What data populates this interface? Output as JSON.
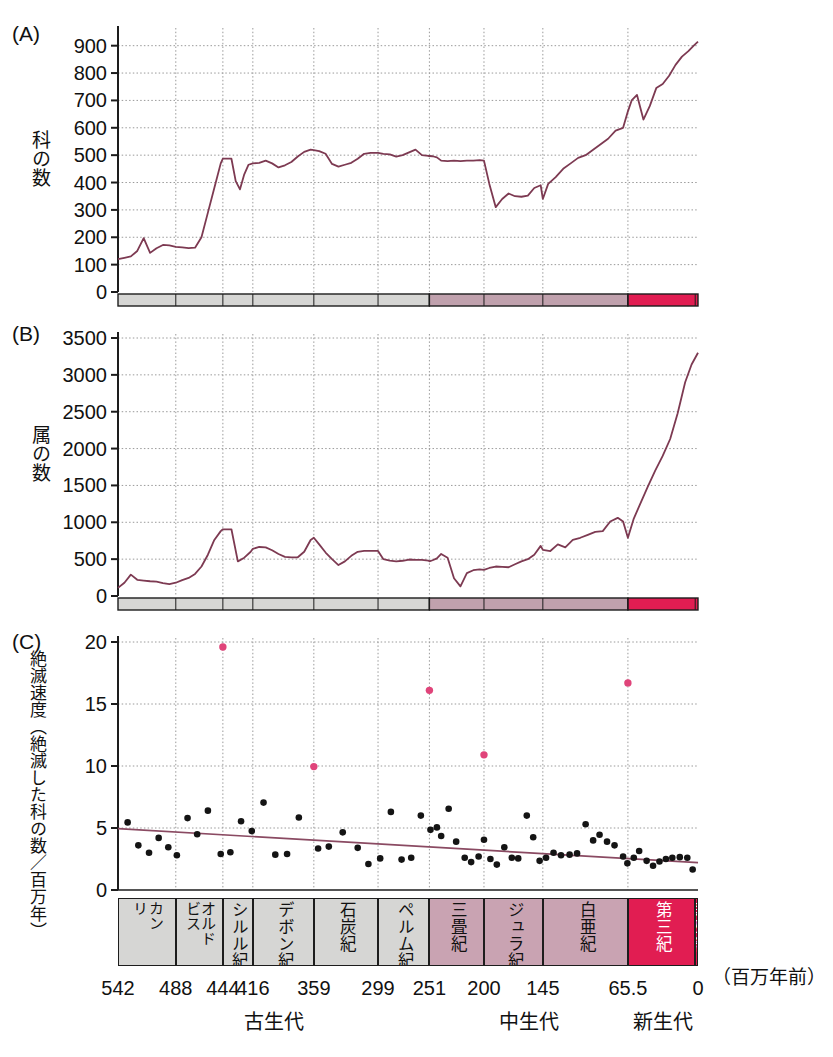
{
  "figure": {
    "panels": [
      "(A)",
      "(B)",
      "(C)"
    ],
    "x_unit_label": "（百万年前）",
    "x_ticks": [
      {
        "label": "542",
        "value": 542
      },
      {
        "label": "488",
        "value": 488
      },
      {
        "label": "444",
        "value": 444
      },
      {
        "label": "416",
        "value": 416
      },
      {
        "label": "359",
        "value": 359
      },
      {
        "label": "299",
        "value": 299
      },
      {
        "label": "251",
        "value": 251
      },
      {
        "label": "200",
        "value": 200
      },
      {
        "label": "145",
        "value": 145
      },
      {
        "label": "65.5",
        "value": 65.5
      },
      {
        "label": "0",
        "value": 0
      }
    ],
    "eras": [
      {
        "name": "古生代",
        "start": 542,
        "end": 251,
        "color": "#d6d6d4"
      },
      {
        "name": "中生代",
        "start": 251,
        "end": 65.5,
        "color": "#c0a1ad"
      },
      {
        "name": "新生代",
        "start": 65.5,
        "end": 0,
        "color": "#e11d52"
      }
    ],
    "periods": [
      {
        "name": "カンブリア紀",
        "start": 542,
        "end": 488,
        "color": "#d6d6d4",
        "lines": [
          "リ",
          "カン"
        ]
      },
      {
        "name": "オルドビス紀",
        "start": 488,
        "end": 444,
        "color": "#d6d6d4",
        "lines": [
          "ビス",
          "オルド"
        ]
      },
      {
        "name": "シルル紀",
        "start": 444,
        "end": 416,
        "color": "#d6d6d4",
        "lines": [
          "シルル紀"
        ]
      },
      {
        "name": "デボン紀",
        "start": 416,
        "end": 359,
        "color": "#d6d6d4",
        "lines": [
          "デボン紀"
        ]
      },
      {
        "name": "石炭紀",
        "start": 359,
        "end": 299,
        "color": "#d6d6d4",
        "lines": [
          "石炭紀"
        ]
      },
      {
        "name": "ペルム紀",
        "start": 299,
        "end": 251,
        "color": "#d6d6d4",
        "lines": [
          "ペルム紀"
        ]
      },
      {
        "name": "三畳紀",
        "start": 251,
        "end": 200,
        "color": "#c9a3b2",
        "lines": [
          "三畳紀"
        ]
      },
      {
        "name": "ジュラ紀",
        "start": 200,
        "end": 145,
        "color": "#c9a3b2",
        "lines": [
          "ジュラ紀"
        ]
      },
      {
        "name": "白亜紀",
        "start": 145,
        "end": 65.5,
        "color": "#c9a3b2",
        "lines": [
          "白亜紀"
        ]
      },
      {
        "name": "第三紀",
        "start": 65.5,
        "end": 2.6,
        "color": "#e11d52",
        "lines": [
          "第三紀"
        ]
      },
      {
        "name": "第四紀",
        "start": 2.6,
        "end": 0,
        "color": "#e11d52",
        "lines": [
          "第四紀"
        ]
      }
    ],
    "colors": {
      "curve": "#7d3a52",
      "marker_normal": "#141414",
      "marker_extinction": "#e0447a",
      "trend_line": "#8a4a62",
      "grid": "#9a9a9a",
      "axis": "#1d1d1d",
      "paleozoic_bar": "#d6d6d4",
      "mesozoic_bar": "#c0a1ad",
      "cenozoic_bar": "#e11d52"
    }
  },
  "chart_data": [
    {
      "type": "line",
      "panel": "(A)",
      "title": "",
      "ylabel": "科の数",
      "xlabel": "（百万年前）",
      "ylim": [
        0,
        950
      ],
      "xlim": [
        542,
        0
      ],
      "y_ticks": [
        0,
        100,
        200,
        300,
        400,
        500,
        600,
        700,
        800,
        900
      ],
      "grid": true,
      "series": [
        {
          "name": "科の数",
          "x": [
            542,
            536,
            530,
            524,
            518,
            512,
            506,
            500,
            494,
            488,
            482,
            476,
            470,
            464,
            458,
            452,
            446,
            444,
            440,
            436,
            432,
            428,
            424,
            420,
            416,
            410,
            404,
            398,
            392,
            386,
            380,
            374,
            368,
            362,
            359,
            354,
            348,
            342,
            336,
            330,
            324,
            318,
            312,
            306,
            300,
            299,
            294,
            288,
            282,
            276,
            270,
            264,
            258,
            252,
            251,
            248,
            244,
            240,
            234,
            228,
            222,
            216,
            210,
            204,
            200,
            195,
            189,
            183,
            177,
            171,
            165,
            159,
            153,
            147,
            145,
            140,
            133,
            126,
            119,
            112,
            105,
            98,
            91,
            84,
            77,
            70,
            65.5,
            62,
            57,
            51,
            45,
            39,
            33,
            27,
            21,
            15,
            9,
            4,
            0
          ],
          "y": [
            120,
            125,
            130,
            150,
            197,
            143,
            160,
            172,
            170,
            165,
            163,
            160,
            162,
            200,
            290,
            380,
            470,
            487,
            487,
            487,
            405,
            375,
            430,
            465,
            470,
            472,
            480,
            470,
            455,
            463,
            475,
            495,
            512,
            520,
            518,
            515,
            505,
            468,
            458,
            465,
            472,
            487,
            505,
            508,
            508,
            508,
            505,
            503,
            495,
            500,
            510,
            520,
            500,
            497,
            497,
            496,
            492,
            480,
            478,
            480,
            478,
            480,
            480,
            482,
            480,
            395,
            310,
            340,
            360,
            350,
            348,
            352,
            380,
            390,
            340,
            395,
            420,
            450,
            470,
            490,
            500,
            520,
            540,
            560,
            590,
            600,
            660,
            700,
            720,
            630,
            680,
            745,
            760,
            790,
            830,
            860,
            880,
            900,
            915
          ]
        }
      ]
    },
    {
      "type": "line",
      "panel": "(B)",
      "title": "",
      "ylabel": "属の数",
      "xlabel": "（百万年前）",
      "ylim": [
        0,
        3500
      ],
      "xlim": [
        542,
        0
      ],
      "y_ticks": [
        0,
        500,
        1000,
        1500,
        2000,
        2500,
        3000,
        3500
      ],
      "grid": true,
      "series": [
        {
          "name": "属の数",
          "x": [
            542,
            536,
            530,
            524,
            518,
            512,
            506,
            500,
            494,
            488,
            482,
            476,
            470,
            464,
            458,
            452,
            446,
            444,
            440,
            436,
            430,
            424,
            418,
            416,
            410,
            404,
            398,
            392,
            386,
            380,
            374,
            368,
            362,
            359,
            354,
            348,
            342,
            336,
            330,
            324,
            318,
            312,
            306,
            300,
            299,
            294,
            288,
            282,
            276,
            270,
            264,
            258,
            252,
            251,
            248,
            244,
            240,
            234,
            228,
            222,
            216,
            210,
            204,
            200,
            195,
            189,
            183,
            177,
            171,
            165,
            159,
            153,
            147,
            145,
            138,
            131,
            124,
            117,
            110,
            103,
            96,
            89,
            82,
            75,
            70,
            65.5,
            60,
            54,
            47,
            40,
            33,
            26,
            19,
            12,
            6,
            0
          ],
          "y": [
            110,
            180,
            290,
            220,
            210,
            200,
            195,
            175,
            160,
            180,
            215,
            245,
            300,
            400,
            560,
            760,
            880,
            905,
            905,
            905,
            470,
            520,
            600,
            640,
            665,
            660,
            620,
            570,
            530,
            525,
            525,
            600,
            760,
            790,
            700,
            590,
            500,
            420,
            470,
            545,
            600,
            612,
            612,
            612,
            612,
            500,
            480,
            470,
            478,
            495,
            490,
            490,
            480,
            470,
            485,
            510,
            570,
            520,
            240,
            130,
            310,
            350,
            360,
            355,
            380,
            400,
            395,
            390,
            430,
            470,
            500,
            560,
            680,
            625,
            610,
            700,
            660,
            760,
            790,
            830,
            870,
            880,
            1010,
            1060,
            1010,
            790,
            1050,
            1250,
            1480,
            1700,
            1900,
            2130,
            2480,
            2900,
            3140,
            3300
          ]
        }
      ]
    },
    {
      "type": "scatter",
      "panel": "(C)",
      "title": "",
      "ylabel": "絶滅速度（絶滅した科の数／百万年）",
      "xlabel": "（百万年前）",
      "ylim": [
        0,
        20
      ],
      "xlim": [
        542,
        0
      ],
      "y_ticks": [
        0,
        5,
        10,
        15,
        20
      ],
      "grid": true,
      "trend": {
        "x": [
          542,
          0
        ],
        "y": [
          4.95,
          2.2
        ],
        "color": "#8a4a62"
      },
      "points_normal": [
        {
          "x": 533,
          "y": 5.45
        },
        {
          "x": 523,
          "y": 3.6
        },
        {
          "x": 513,
          "y": 3.0
        },
        {
          "x": 504,
          "y": 4.2
        },
        {
          "x": 495,
          "y": 3.45
        },
        {
          "x": 487,
          "y": 2.8
        },
        {
          "x": 477,
          "y": 5.8
        },
        {
          "x": 468,
          "y": 4.5
        },
        {
          "x": 458,
          "y": 6.4
        },
        {
          "x": 446,
          "y": 2.9
        },
        {
          "x": 437,
          "y": 3.05
        },
        {
          "x": 427,
          "y": 5.55
        },
        {
          "x": 417,
          "y": 4.75
        },
        {
          "x": 406,
          "y": 7.05
        },
        {
          "x": 395,
          "y": 2.85
        },
        {
          "x": 384,
          "y": 2.9
        },
        {
          "x": 373,
          "y": 5.85
        },
        {
          "x": 355,
          "y": 3.35
        },
        {
          "x": 345,
          "y": 3.5
        },
        {
          "x": 332,
          "y": 4.65
        },
        {
          "x": 318,
          "y": 3.4
        },
        {
          "x": 308,
          "y": 2.1
        },
        {
          "x": 297,
          "y": 2.55
        },
        {
          "x": 287,
          "y": 6.3
        },
        {
          "x": 277,
          "y": 2.45
        },
        {
          "x": 268,
          "y": 2.6
        },
        {
          "x": 259,
          "y": 6.0
        },
        {
          "x": 250,
          "y": 4.85
        },
        {
          "x": 244,
          "y": 5.05
        },
        {
          "x": 240,
          "y": 4.35
        },
        {
          "x": 233,
          "y": 6.55
        },
        {
          "x": 226,
          "y": 3.9
        },
        {
          "x": 218,
          "y": 2.6
        },
        {
          "x": 212,
          "y": 2.25
        },
        {
          "x": 205,
          "y": 2.7
        },
        {
          "x": 200,
          "y": 4.05
        },
        {
          "x": 194,
          "y": 2.5
        },
        {
          "x": 188,
          "y": 2.05
        },
        {
          "x": 181,
          "y": 3.45
        },
        {
          "x": 174,
          "y": 2.6
        },
        {
          "x": 168,
          "y": 2.55
        },
        {
          "x": 160,
          "y": 6.0
        },
        {
          "x": 154,
          "y": 4.25
        },
        {
          "x": 148,
          "y": 2.35
        },
        {
          "x": 142,
          "y": 2.6
        },
        {
          "x": 135,
          "y": 3.0
        },
        {
          "x": 128,
          "y": 2.8
        },
        {
          "x": 120,
          "y": 2.85
        },
        {
          "x": 113,
          "y": 2.95
        },
        {
          "x": 105,
          "y": 5.3
        },
        {
          "x": 98,
          "y": 4.0
        },
        {
          "x": 92,
          "y": 4.45
        },
        {
          "x": 85,
          "y": 3.9
        },
        {
          "x": 78,
          "y": 3.6
        },
        {
          "x": 70,
          "y": 2.7
        },
        {
          "x": 66,
          "y": 2.15
        },
        {
          "x": 60,
          "y": 2.6
        },
        {
          "x": 55,
          "y": 3.15
        },
        {
          "x": 48,
          "y": 2.35
        },
        {
          "x": 42,
          "y": 1.95
        },
        {
          "x": 36,
          "y": 2.3
        },
        {
          "x": 30,
          "y": 2.5
        },
        {
          "x": 24,
          "y": 2.6
        },
        {
          "x": 17,
          "y": 2.65
        },
        {
          "x": 10,
          "y": 2.6
        },
        {
          "x": 5,
          "y": 1.65
        }
      ],
      "points_extinction": [
        {
          "x": 444,
          "y": 19.6,
          "event": "オルドビス紀末"
        },
        {
          "x": 359,
          "y": 9.95,
          "event": "デボン紀後期"
        },
        {
          "x": 251,
          "y": 16.1,
          "event": "ペルム紀末"
        },
        {
          "x": 200,
          "y": 10.9,
          "event": "三畳紀末"
        },
        {
          "x": 65.5,
          "y": 16.7,
          "event": "白亜紀末"
        }
      ]
    }
  ]
}
